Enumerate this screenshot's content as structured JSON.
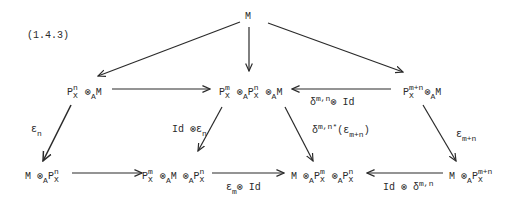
{
  "equation_number": "(1.4.3)",
  "nodes": {
    "top": "M",
    "mid_left": {
      "base": "P",
      "sup": "n",
      "sub": "X",
      "rest_op": "⊗",
      "rest_sub": "A",
      "rest": "M"
    },
    "mid_center": {
      "p1_sup": "m",
      "p1_sub": "X",
      "op1": "⊗",
      "op1_sub": "A",
      "p2_sup": "n",
      "p2_sub": "X",
      "op2": "⊗",
      "op2_sub": "A",
      "tail": "M"
    },
    "mid_right": {
      "base": "P",
      "sup": "m+n",
      "sub": "X",
      "op": "⊗",
      "op_sub": "A",
      "tail": "M"
    },
    "bot_1": {
      "head": "M",
      "op": "⊗",
      "op_sub": "A",
      "base": "P",
      "sup": "n",
      "sub": "X"
    },
    "bot_2": {
      "base": "P",
      "sup": "m",
      "sub": "X",
      "op1": "⊗",
      "op1_sub": "A",
      "mid": "M",
      "op2": "⊗",
      "op2_sub": "A",
      "base2": "P",
      "sup2": "n",
      "sub2": "X"
    },
    "bot_3": {
      "head": "M",
      "op1": "⊗",
      "op1_sub": "A",
      "sup1": "m",
      "sub1": "X",
      "op2": "⊗",
      "op2_sub": "A",
      "sup2": "n",
      "sub2": "X"
    },
    "bot_4": {
      "head": "M",
      "op": "⊗",
      "op_sub": "A",
      "base": "P",
      "sup": "m+n",
      "sub": "X"
    }
  },
  "labels": {
    "eps_n": {
      "sym": "ε",
      "sub": "n"
    },
    "id_eps_n": {
      "text": "Id ⊗",
      "sym": "ε",
      "sub": "n"
    },
    "delta_id": {
      "sym": "δ",
      "sup": "m,n",
      "tail": "⊗ Id"
    },
    "delta_star": {
      "sym": "δ",
      "sup": "m,n*",
      "open": "(",
      "inner": "ε",
      "inner_sub": "m+n",
      "close": ")"
    },
    "eps_mn": {
      "sym": "ε",
      "sub": "m+n"
    },
    "eps_m_id": {
      "sym": "ε",
      "sub": "m",
      "tail": "⊗ Id"
    },
    "id_delta": {
      "text": "Id ⊗ ",
      "sym": "δ",
      "sup": "m,n"
    }
  },
  "colors": {
    "ink": "#2a2a2a",
    "background": "#ffffff"
  }
}
